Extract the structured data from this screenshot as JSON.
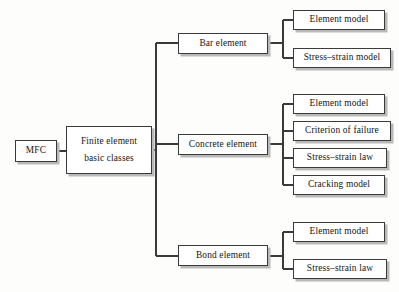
{
  "diagram": {
    "background_color": "#fdfdfb",
    "box_border_color": "#3a3a3a",
    "box_fill_color": "#ffffff",
    "shadow_color": "#b9b9b9",
    "connector_color": "#3a3a3a"
  },
  "root": {
    "label": "MFC"
  },
  "level2": {
    "line1": "Finite  element",
    "line2": "basic classes"
  },
  "branches": [
    {
      "label": "Bar element",
      "children": [
        {
          "label": "Element model"
        },
        {
          "label": "Stress–strain model"
        }
      ]
    },
    {
      "label": "Concrete element",
      "children": [
        {
          "label": "Element model"
        },
        {
          "label": "Criterion of failure"
        },
        {
          "label": "Stress–strain law"
        },
        {
          "label": "Cracking model"
        }
      ]
    },
    {
      "label": "Bond element",
      "children": [
        {
          "label": "Element model"
        },
        {
          "label": "Stress–strain law"
        }
      ]
    }
  ]
}
